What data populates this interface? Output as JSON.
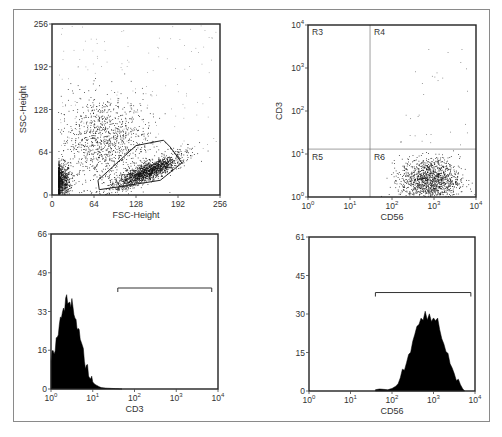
{
  "figure": {
    "panels": [
      {
        "id": "scatter-fsc-ssc",
        "xlabel": "FSC-Height",
        "ylabel": "SSC-Height"
      },
      {
        "id": "dot-cd56-cd3",
        "xlabel": "CD56",
        "ylabel": "CD3",
        "regions": [
          "R3",
          "R4",
          "R5",
          "R6"
        ]
      },
      {
        "id": "hist-cd3",
        "xlabel": "CD3"
      },
      {
        "id": "hist-cd56",
        "xlabel": "CD56"
      }
    ]
  },
  "chart_data": [
    {
      "type": "scatter",
      "title": "",
      "xlabel": "FSC-Height",
      "ylabel": "SSC-Height",
      "xlim": [
        0,
        256
      ],
      "ylim": [
        0,
        256
      ],
      "xticks": [
        "0",
        "64",
        "128",
        "192",
        "256"
      ],
      "yticks": [
        "0",
        "64",
        "128",
        "192",
        "256"
      ],
      "populations": [
        {
          "name": "debris/low",
          "center": [
            12,
            20
          ],
          "spread": [
            8,
            14
          ],
          "density": "high"
        },
        {
          "name": "granulocyte-like diffuse",
          "center": [
            80,
            80
          ],
          "spread": [
            35,
            35
          ],
          "density": "medium"
        },
        {
          "name": "gated lymphocytes",
          "center": [
            145,
            35
          ],
          "spread": [
            22,
            10
          ],
          "density": "very high"
        }
      ],
      "gate_polygon": [
        [
          72,
          8
        ],
        [
          70,
          22
        ],
        [
          128,
          74
        ],
        [
          170,
          82
        ],
        [
          180,
          72
        ],
        [
          198,
          48
        ],
        [
          165,
          22
        ],
        [
          100,
          12
        ]
      ],
      "grid": false
    },
    {
      "type": "scatter",
      "title": "",
      "xlabel": "CD56",
      "ylabel": "CD3",
      "xscale": "log",
      "yscale": "log",
      "xlim": [
        1,
        10000
      ],
      "ylim": [
        1,
        10000
      ],
      "xticks": [
        "10^0",
        "10^1",
        "10^2",
        "10^3",
        "10^4"
      ],
      "yticks": [
        "10^0",
        "10^1",
        "10^2",
        "10^3",
        "10^4"
      ],
      "quadrant_x": 30,
      "quadrant_y": 13,
      "quadrants": [
        {
          "label": "R3",
          "position": "upper-left"
        },
        {
          "label": "R4",
          "position": "upper-right"
        },
        {
          "label": "R5",
          "position": "lower-left"
        },
        {
          "label": "R6",
          "position": "lower-right"
        }
      ],
      "populations": [
        {
          "name": "CD56+ CD3-",
          "center_log": [
            2.9,
            0.4
          ],
          "spread_log": [
            0.35,
            0.25
          ],
          "quadrant": "R6",
          "density": "high"
        }
      ],
      "grid": false
    },
    {
      "type": "area",
      "title": "",
      "xlabel": "CD3",
      "ylabel": "",
      "xscale": "log",
      "xlim": [
        1,
        10000
      ],
      "ylim": [
        0,
        66
      ],
      "xticks": [
        "10^0",
        "10^1",
        "10^2",
        "10^3",
        "10^4"
      ],
      "yticks": [
        "0",
        "16",
        "33",
        "49",
        "66"
      ],
      "x_log": [
        0.0,
        0.05,
        0.1,
        0.15,
        0.2,
        0.25,
        0.3,
        0.35,
        0.4,
        0.45,
        0.5,
        0.55,
        0.6,
        0.65,
        0.7,
        0.75,
        0.8,
        0.85,
        0.9,
        0.95,
        1.0,
        1.05,
        1.1,
        1.15,
        1.2,
        1.3,
        1.4,
        1.5,
        1.6,
        1.7
      ],
      "values": [
        12,
        16,
        17,
        22,
        27,
        31,
        33,
        37,
        38,
        36,
        37,
        33,
        29,
        25,
        21,
        17,
        13,
        10,
        7,
        5,
        3,
        2,
        1.5,
        1,
        0.6,
        0.4,
        0.3,
        0.2,
        0.1,
        0
      ],
      "marker": {
        "x_log_start": 1.6,
        "x_log_end": 3.85,
        "y": 43
      }
    },
    {
      "type": "area",
      "title": "",
      "xlabel": "CD56",
      "ylabel": "",
      "xscale": "log",
      "xlim": [
        1,
        10000
      ],
      "ylim": [
        0,
        61
      ],
      "xticks": [
        "10^0",
        "10^1",
        "10^2",
        "10^3",
        "10^4"
      ],
      "yticks": [
        "0",
        "15",
        "30",
        "45",
        "61"
      ],
      "x_log": [
        1.6,
        1.7,
        1.9,
        2.0,
        2.1,
        2.2,
        2.3,
        2.4,
        2.5,
        2.6,
        2.7,
        2.8,
        2.9,
        3.0,
        3.1,
        3.2,
        3.3,
        3.4,
        3.5,
        3.6,
        3.7,
        3.75
      ],
      "values": [
        0.5,
        0.8,
        0.5,
        1,
        2,
        4,
        9,
        15,
        20,
        26,
        29,
        32,
        30,
        29,
        27,
        22,
        16,
        11,
        7,
        4,
        1,
        0
      ],
      "marker": {
        "x_log_start": 1.6,
        "x_log_end": 3.9,
        "y": 39
      }
    }
  ]
}
